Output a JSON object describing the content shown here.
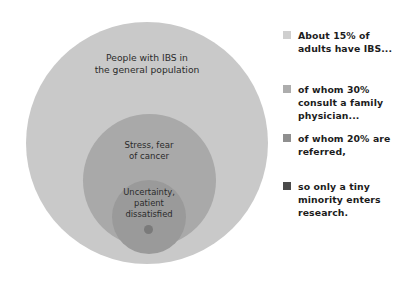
{
  "chart_data": {
    "type": "venn",
    "title": "",
    "layers": [
      {
        "label": "People with IBS in\nthe general population",
        "legend": "About 15% of\nadults have IBS...",
        "color": "#c9c9c9",
        "swatch_color": "#cfcfcf",
        "share_pct": 15
      },
      {
        "label": "",
        "legend": "of whom 30%\nconsult a family\nphysician...",
        "color": "#a9a9a9",
        "swatch_color": "#adadad",
        "share_pct": 30
      },
      {
        "label": "Stress, fear\nof cancer",
        "legend": "of whom 20% are\nreferred,",
        "color": "#9a9a9a",
        "swatch_color": "#8f8f8f",
        "share_pct": 20
      },
      {
        "label": "Uncertainty,\npatient\ndissatisfied",
        "legend": "so only a tiny\nminority enters\nresearch.",
        "color": "#7a7a7a",
        "swatch_color": "#4a4a4a",
        "share_pct": null
      }
    ]
  },
  "diagram": {
    "outer_label": "People with IBS in\nthe general population",
    "middle_label": "Stress, fear\nof cancer",
    "inner_label": "Uncertainty,\npatient\ndissatisfied",
    "outer_color": "#c9c9c9",
    "middle_color": "#a9a9a9",
    "inner_color": "#9a9a9a",
    "dot_color": "#7a7a7a"
  },
  "legend": {
    "items": [
      {
        "text": "About 15% of\nadults have IBS...",
        "color": "#cfcfcf"
      },
      {
        "text": "of whom 30%\nconsult a family\nphysician...",
        "color": "#adadad"
      },
      {
        "text": "of whom 20% are\nreferred,",
        "color": "#8f8f8f"
      },
      {
        "text": "so only a tiny\nminority enters\nresearch.",
        "color": "#4a4a4a"
      }
    ]
  }
}
